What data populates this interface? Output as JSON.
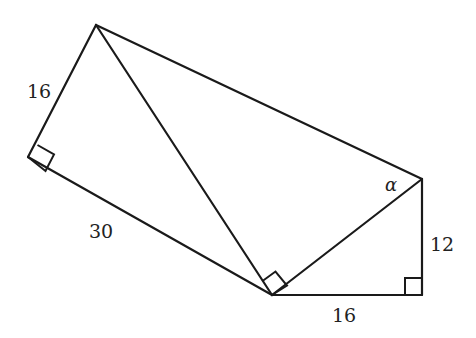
{
  "diagram": {
    "type": "geometry",
    "points": {
      "A": [
        96,
        25
      ],
      "B": [
        28,
        157
      ],
      "C": [
        272,
        295
      ],
      "D": [
        422,
        179
      ],
      "E": [
        422,
        295
      ]
    },
    "segments": [
      [
        "A",
        "B"
      ],
      [
        "B",
        "C"
      ],
      [
        "A",
        "C"
      ],
      [
        "A",
        "D"
      ],
      [
        "C",
        "D"
      ],
      [
        "D",
        "E"
      ],
      [
        "C",
        "E"
      ]
    ],
    "right_angles": [
      "B",
      "C (between AC and CD)",
      "E"
    ],
    "labels": {
      "ab": "16",
      "bc": "30",
      "de": "12",
      "ce": "16",
      "angle": "α"
    }
  }
}
